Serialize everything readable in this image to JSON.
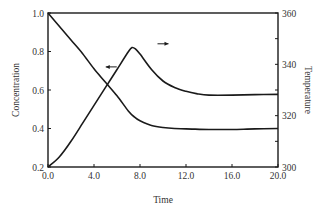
{
  "chart_data": {
    "type": "line",
    "title": "",
    "xlabel": "Time",
    "ylabel_left": "Concentration",
    "ylabel_right": "Temperature",
    "xlim": [
      0,
      20
    ],
    "ylim_left": [
      0.2,
      1.0
    ],
    "ylim_right": [
      300,
      360
    ],
    "x_ticks": [
      "0.0",
      "4.0",
      "8.0",
      "12.0",
      "16.0",
      "20.0"
    ],
    "y_left_ticks": [
      "0.2",
      "0.4",
      "0.6",
      "0.8",
      "1.0"
    ],
    "y_right_ticks": [
      "300",
      "320",
      "340",
      "360"
    ],
    "grid": false,
    "legend": "none (arrows indicate axis for each curve)",
    "annotations": [
      {
        "type": "arrow",
        "direction": "left",
        "points_to": "Concentration axis",
        "x": 5.5,
        "y_left": 0.72
      },
      {
        "type": "arrow",
        "direction": "right",
        "points_to": "Temperature axis",
        "x": 10.0,
        "y_right": 348
      }
    ],
    "series": [
      {
        "name": "Concentration",
        "axis": "left",
        "x": [
          0,
          1,
          2,
          3,
          4,
          5,
          6,
          7,
          7.5,
          8,
          9,
          10,
          11,
          12,
          14,
          16,
          18,
          20
        ],
        "values": [
          1.0,
          0.93,
          0.86,
          0.79,
          0.71,
          0.64,
          0.57,
          0.49,
          0.46,
          0.44,
          0.415,
          0.405,
          0.4,
          0.398,
          0.395,
          0.395,
          0.398,
          0.4
        ]
      },
      {
        "name": "Temperature",
        "axis": "right",
        "x": [
          0,
          1,
          2,
          3,
          4,
          5,
          6,
          7,
          7.3,
          7.6,
          8,
          9,
          10,
          11,
          12,
          13,
          14,
          16,
          18,
          20
        ],
        "values": [
          300,
          304,
          310,
          317,
          324,
          331,
          338,
          345,
          346.5,
          346,
          344,
          338,
          333.5,
          331,
          329.5,
          328.5,
          328,
          328,
          328.2,
          328.3
        ]
      }
    ]
  },
  "axes": {
    "x_title": "Time",
    "y_left_title": "Concentration",
    "y_right_title": "Temperature"
  }
}
